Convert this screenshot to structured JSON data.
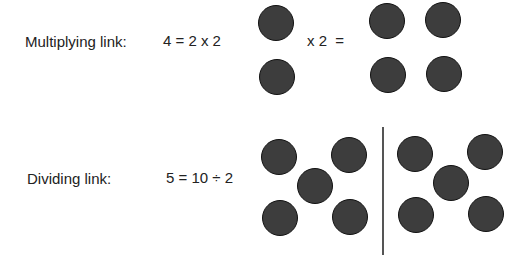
{
  "multiplying": {
    "label": "Multiplying link:",
    "equation": "4 = 2 x 2",
    "operator": "x 2  =",
    "left_group_count": 2,
    "right_group_count": 4
  },
  "dividing": {
    "label": "Dividing link:",
    "equation": "5 = 10 ÷ 2",
    "group_count": 2,
    "per_group": 5
  },
  "colors": {
    "dot_fill": "#3d3d3d",
    "dot_border": "#111111",
    "divider": "#555555"
  }
}
